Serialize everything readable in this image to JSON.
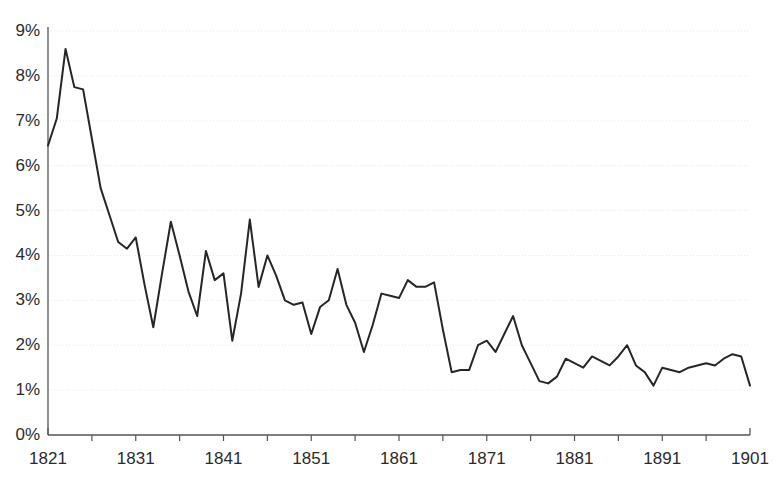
{
  "chart_data": {
    "type": "line",
    "title": "",
    "subtitle": "",
    "xlabel": "",
    "ylabel": "",
    "xlim": [
      1821,
      1901
    ],
    "ylim": [
      0,
      9
    ],
    "grid": true,
    "legend": null,
    "y_tick_labels": [
      "0%",
      "1%",
      "2%",
      "3%",
      "4%",
      "5%",
      "6%",
      "7%",
      "8%",
      "9%"
    ],
    "y_tick_values": [
      0,
      1,
      2,
      3,
      4,
      5,
      6,
      7,
      8,
      9
    ],
    "x_tick_labels": [
      "1821",
      "1831",
      "1841",
      "1851",
      "1861",
      "1871",
      "1881",
      "1891",
      "1901"
    ],
    "x_tick_values": [
      1821,
      1831,
      1841,
      1851,
      1861,
      1871,
      1881,
      1891,
      1901
    ],
    "x_minor_tick_values": [
      1826,
      1836,
      1846,
      1856,
      1866,
      1876,
      1886,
      1896
    ],
    "line_color": "#262626",
    "line_width": 2,
    "grid_color": "#e8e8e8",
    "axis_color": "#555555",
    "series": [
      {
        "name": "value",
        "x": [
          1821,
          1822,
          1823,
          1824,
          1825,
          1826,
          1827,
          1828,
          1829,
          1830,
          1831,
          1832,
          1833,
          1834,
          1835,
          1836,
          1837,
          1838,
          1839,
          1840,
          1841,
          1842,
          1843,
          1844,
          1845,
          1846,
          1847,
          1848,
          1849,
          1850,
          1851,
          1852,
          1853,
          1854,
          1855,
          1856,
          1857,
          1858,
          1859,
          1860,
          1861,
          1862,
          1863,
          1864,
          1865,
          1866,
          1867,
          1868,
          1869,
          1870,
          1871,
          1872,
          1873,
          1874,
          1875,
          1876,
          1877,
          1878,
          1879,
          1880,
          1881,
          1882,
          1883,
          1884,
          1885,
          1886,
          1887,
          1888,
          1889,
          1890,
          1891,
          1892,
          1893,
          1894,
          1895,
          1896,
          1897,
          1898,
          1899,
          1900,
          1901
        ],
        "values": [
          6.45,
          7.05,
          8.6,
          7.75,
          7.7,
          6.6,
          5.5,
          4.9,
          4.3,
          4.15,
          4.4,
          3.35,
          2.4,
          3.6,
          4.75,
          4.0,
          3.2,
          2.65,
          4.1,
          3.45,
          3.6,
          2.1,
          3.15,
          4.8,
          3.3,
          4.0,
          3.55,
          3.0,
          2.9,
          2.95,
          2.25,
          2.85,
          3.0,
          3.7,
          2.9,
          2.5,
          1.85,
          2.45,
          3.15,
          3.1,
          3.05,
          3.45,
          3.3,
          3.3,
          3.4,
          2.35,
          1.4,
          1.45,
          1.45,
          2.0,
          2.1,
          1.85,
          2.25,
          2.65,
          2.0,
          1.6,
          1.2,
          1.15,
          1.3,
          1.7,
          1.6,
          1.5,
          1.75,
          1.65,
          1.55,
          1.75,
          2.0,
          1.55,
          1.4,
          1.1,
          1.5,
          1.45,
          1.4,
          1.5,
          1.55,
          1.6,
          1.55,
          1.7,
          1.8,
          1.75,
          1.1
        ]
      }
    ]
  },
  "axes": {
    "y_axis_name": "percentage-axis",
    "x_axis_name": "year-axis"
  }
}
